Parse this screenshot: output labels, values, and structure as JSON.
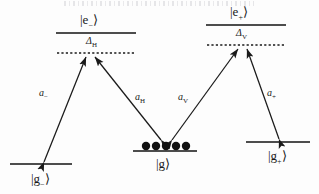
{
  "figure": {
    "type": "energy-level-diagram",
    "background_color": "#fdfdfd",
    "line_color": "#4d4d4d",
    "arrow_color": "#1a1a1a",
    "atom_color": "#111111"
  },
  "levels": {
    "excited_left": {
      "label_ket": "|e",
      "label_sub": "−",
      "label_close": "⟩",
      "x": 56,
      "y": 33,
      "width": 80
    },
    "excited_right": {
      "label_ket": "|e",
      "label_sub": "+",
      "label_close": "⟩",
      "x": 206,
      "y": 25,
      "width": 80
    },
    "ground_left": {
      "label_ket": "|g",
      "label_sub": "−",
      "label_close": "⟩",
      "x": 10,
      "y": 169,
      "width": 62
    },
    "ground_center": {
      "label_ket": "|g",
      "label_sub": "",
      "label_close": "⟩",
      "x": 133,
      "y": 153,
      "width": 64
    },
    "ground_right": {
      "label_ket": "|g",
      "label_sub": "+",
      "label_close": "⟩",
      "x": 246,
      "y": 145,
      "width": 64
    }
  },
  "virtual_levels": {
    "left": {
      "x": 56,
      "y": 53,
      "width": 80
    },
    "right": {
      "x": 206,
      "y": 45,
      "width": 80
    }
  },
  "detunings": [
    {
      "name": "delta-h",
      "symbol": "Δ",
      "sub": "H",
      "x": 86,
      "y": 36
    },
    {
      "name": "delta-v",
      "symbol": "Δ",
      "sub": "V",
      "x": 236,
      "y": 28
    }
  ],
  "amplitudes": [
    {
      "name": "a-minus",
      "symbol": "a",
      "sub": "−",
      "x": 39,
      "y": 88
    },
    {
      "name": "a-h",
      "symbol": "a",
      "sub": "H",
      "x": 135,
      "y": 92
    },
    {
      "name": "a-v",
      "symbol": "a",
      "sub": "V",
      "x": 178,
      "y": 92
    },
    {
      "name": "a-plus",
      "symbol": "a",
      "sub": "+",
      "x": 267,
      "y": 88
    }
  ],
  "atoms": {
    "count": 5,
    "radius": 4.2,
    "x_start": 146,
    "spacing": 10,
    "y": 146
  },
  "transitions": [
    {
      "name": "transition-gminus-to-eleft",
      "from": "ground_left",
      "to": "virtual_left",
      "direction": "both"
    },
    {
      "name": "transition-g-to-eleft",
      "from": "ground_center",
      "to": "virtual_left",
      "direction": "both"
    },
    {
      "name": "transition-g-to-eright",
      "from": "ground_center",
      "to": "virtual_right",
      "direction": "both"
    },
    {
      "name": "transition-gplus-to-eright",
      "from": "ground_right",
      "to": "virtual_right",
      "direction": "both"
    }
  ]
}
